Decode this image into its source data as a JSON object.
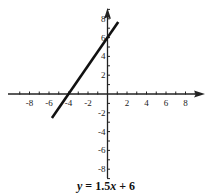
{
  "chart_data": {
    "type": "line",
    "title": "",
    "caption": "y = 1.5x + 6",
    "caption_parts": {
      "y": "y",
      "eq": " = 1.5",
      "x": "x",
      "rest": " + 6"
    },
    "xlabel": "",
    "ylabel": "",
    "xlim": [
      -10,
      10
    ],
    "ylim": [
      -9,
      9
    ],
    "x_ticks": [
      -8,
      -6,
      -4,
      -2,
      2,
      4,
      6,
      8
    ],
    "y_ticks": [
      -8,
      -6,
      -4,
      -2,
      2,
      4,
      6,
      8
    ],
    "grid": false,
    "series": [
      {
        "name": "y = 1.5x + 6",
        "slope": 1.5,
        "intercept": 6,
        "x": [
          -5.7,
          1.1
        ],
        "y": [
          -2.55,
          7.65
        ]
      }
    ]
  }
}
